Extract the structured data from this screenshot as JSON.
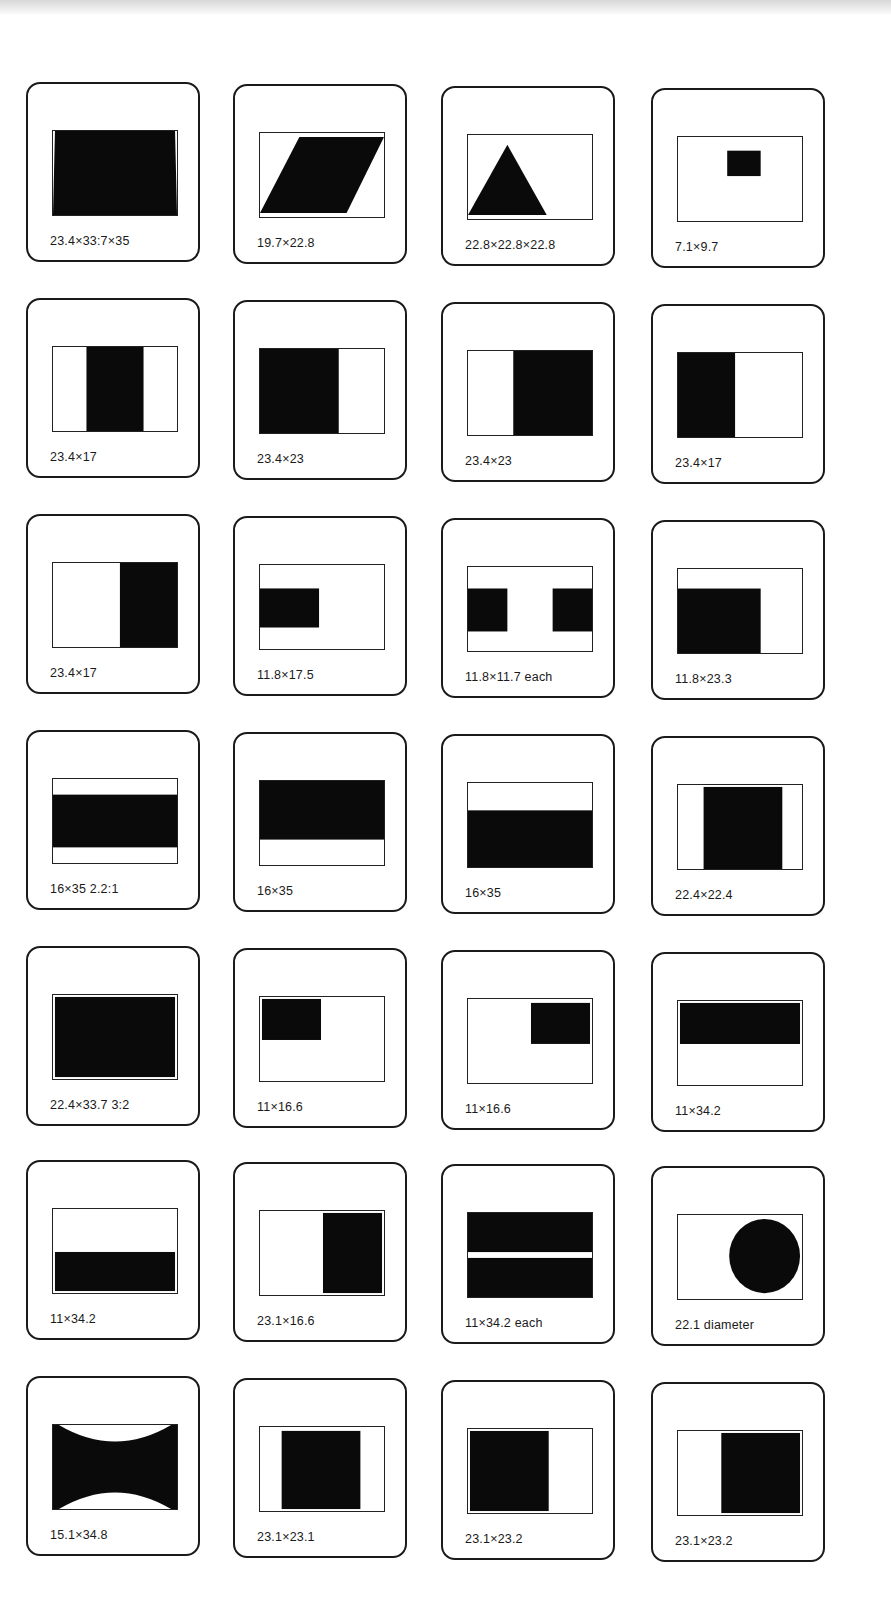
{
  "slides": [
    {
      "label": "23.4×33:7×35",
      "shape": "trapezoid"
    },
    {
      "label": "19.7×22.8",
      "shape": "parallelogram"
    },
    {
      "label": "22.8×22.8×22.8",
      "shape": "triangle"
    },
    {
      "label": "7.1×9.7",
      "shape": "small-rect"
    },
    {
      "label": "23.4×17",
      "shape": "center-vertical"
    },
    {
      "label": "23.4×23",
      "shape": "left-square"
    },
    {
      "label": "23.4×23",
      "shape": "right-square"
    },
    {
      "label": "23.4×17",
      "shape": "left-vertical"
    },
    {
      "label": "23.4×17",
      "shape": "right-vertical"
    },
    {
      "label": "11.8×17.5",
      "shape": "left-small"
    },
    {
      "label": "11.8×11.7 each",
      "shape": "two-squares"
    },
    {
      "label": "11.8×23.3",
      "shape": "left-wide"
    },
    {
      "label": "16×35 2.2:1",
      "shape": "center-band"
    },
    {
      "label": "16×35",
      "shape": "top-band"
    },
    {
      "label": "16×35",
      "shape": "bottom-band"
    },
    {
      "label": "22.4×22.4",
      "shape": "center-square"
    },
    {
      "label": "22.4×33.7  3:2",
      "shape": "full"
    },
    {
      "label": "11×16.6",
      "shape": "top-left-small"
    },
    {
      "label": "11×16.6",
      "shape": "top-right-small"
    },
    {
      "label": "11×34.2",
      "shape": "top-strip"
    },
    {
      "label": "11×34.2",
      "shape": "bottom-strip"
    },
    {
      "label": "23.1×16.6",
      "shape": "right-vertical-2"
    },
    {
      "label": "11×34.2 each",
      "shape": "two-strips"
    },
    {
      "label": "22.1 diameter",
      "shape": "circle"
    },
    {
      "label": "15.1×34.8",
      "shape": "hourglass"
    },
    {
      "label": "23.1×23.1",
      "shape": "center-square-2"
    },
    {
      "label": "23.1×23.2",
      "shape": "left-square-2"
    },
    {
      "label": "23.1×23.2",
      "shape": "right-square-2"
    }
  ]
}
